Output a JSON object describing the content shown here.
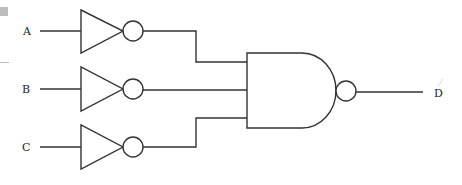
{
  "diagram": {
    "type": "logic-circuit",
    "inputs": [
      {
        "label": "A",
        "y": 31
      },
      {
        "label": "B",
        "y": 89
      },
      {
        "label": "C",
        "y": 147
      }
    ],
    "output": {
      "label": "D",
      "y": 94
    },
    "gates": [
      {
        "id": "not-a",
        "type": "NOT",
        "input": "A"
      },
      {
        "id": "not-b",
        "type": "NOT",
        "input": "B"
      },
      {
        "id": "not-c",
        "type": "NOT",
        "input": "C"
      },
      {
        "id": "nand",
        "type": "NAND",
        "inputs": [
          "not-a",
          "not-b",
          "not-c"
        ],
        "output": "D"
      }
    ],
    "colors": {
      "stroke": "#333333",
      "background": "#ffffff"
    }
  }
}
